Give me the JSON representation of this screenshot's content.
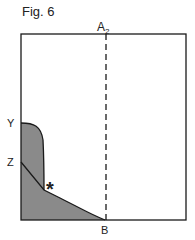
{
  "figure": {
    "title": "Fig. 6",
    "labels": {
      "a2": "A",
      "a2_sub": "2",
      "y": "Y",
      "z": "Z",
      "b": "B",
      "asterisk": "*"
    },
    "colors": {
      "line": "#1a1a1a",
      "fill": "#8a8a8a",
      "background": "#ffffff"
    }
  }
}
